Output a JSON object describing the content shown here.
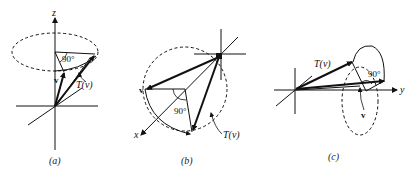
{
  "panels": [
    {
      "id": "a",
      "caption": "(a)",
      "axis_label": "z",
      "angle_label": "90°",
      "vector_label": "v",
      "transform_label": "T(v)"
    },
    {
      "id": "b",
      "caption": "(b)",
      "axis_label": "x",
      "angle_label": "90°",
      "vector_label": "v",
      "transform_label": "T(v)"
    },
    {
      "id": "c",
      "caption": "(c)",
      "axis_label": "y",
      "angle_label": "90°",
      "vector_label": "v",
      "transform_label": "T(v)"
    }
  ],
  "colors": {
    "ink": "#111111",
    "background": "#ffffff"
  }
}
